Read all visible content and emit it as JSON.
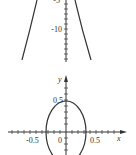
{
  "figures": [
    {
      "id": "upper-plot",
      "description": "Downward-opening parabola, lower portion",
      "y_tick_labels": [
        "-5",
        "-10"
      ],
      "curve": "parabola"
    },
    {
      "id": "lower-plot",
      "description": "Ellipse centered at origin",
      "axis_labels": {
        "x": "x",
        "y": "y"
      },
      "x_tick_labels": [
        "-0.5",
        "0",
        "0.5"
      ],
      "y_tick_labels": [
        "0.5"
      ],
      "curve": "ellipse"
    }
  ],
  "upper": {
    "label_m5": "-5",
    "label_m10": "-10"
  },
  "lower": {
    "x_label": "x",
    "y_label": "y",
    "label_m05": "-0.5",
    "label_0": "0",
    "label_05": "0.5",
    "label_y05": "0.5"
  }
}
